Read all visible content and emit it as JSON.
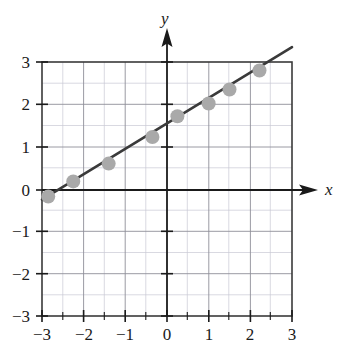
{
  "chart_data": {
    "type": "scatter",
    "title": "",
    "subtitle": "",
    "xlabel": "x",
    "ylabel": "y",
    "xlim": [
      -3,
      3
    ],
    "ylim": [
      -3,
      3
    ],
    "grid": true,
    "grid_major_step": 1,
    "grid_minor_step": 0.5,
    "legend": null,
    "legend_position": "none",
    "xticks": [
      -3,
      -2,
      -1,
      0,
      1,
      2,
      3
    ],
    "yticks": [
      -3,
      -2,
      -1,
      0,
      1,
      2,
      3
    ],
    "xtick_labels": [
      "−3",
      "−2",
      "−1",
      "0",
      "1",
      "2",
      "3"
    ],
    "ytick_labels": [
      "3",
      "2",
      "1",
      "0",
      "−1",
      "−2",
      "−3"
    ],
    "points": [
      {
        "x": -2.85,
        "y": -0.18
      },
      {
        "x": -2.25,
        "y": 0.18
      },
      {
        "x": -1.4,
        "y": 0.6
      },
      {
        "x": -0.35,
        "y": 1.23
      },
      {
        "x": 0.25,
        "y": 1.72
      },
      {
        "x": 1.0,
        "y": 2.02
      },
      {
        "x": 1.5,
        "y": 2.35
      },
      {
        "x": 2.22,
        "y": 2.8
      }
    ],
    "series": [
      {
        "name": "data points",
        "type": "scatter",
        "marker": "circle",
        "color": "#a9a9a9",
        "x": [
          -2.85,
          -2.25,
          -1.4,
          -0.35,
          0.25,
          1.0,
          1.5,
          2.22
        ],
        "values": [
          -0.18,
          0.18,
          0.6,
          1.23,
          1.72,
          2.02,
          2.35,
          2.8
        ]
      },
      {
        "name": "regression line",
        "type": "line",
        "color": "#3a3a3a",
        "slope": 0.6,
        "intercept": 1.55,
        "x_start": -3,
        "y_start": -0.25,
        "x_end": 2.42,
        "y_end": 3.0
      }
    ],
    "colors": {
      "point_fill": "#a9a9a9",
      "line": "#3a3a3a",
      "axis": "#1a1a1a",
      "grid_major": "#8c8c96",
      "grid_minor": "#c8c8d2",
      "frame": "#3a3a3a",
      "background": "#ffffff",
      "text": "#1a1a1a"
    }
  },
  "axes": {
    "x_axis_label": "x",
    "y_axis_label": "y"
  }
}
